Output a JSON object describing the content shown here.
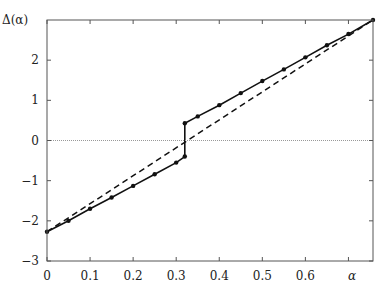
{
  "chart_data": {
    "type": "line",
    "title": "",
    "xlabel": "α",
    "ylabel": "Δ(α)",
    "xlim": [
      0,
      0.757
    ],
    "ylim": [
      -3,
      3
    ],
    "grid": false,
    "x_ticks": [
      "0",
      "0.1",
      "0.2",
      "0.3",
      "0.4",
      "0.5",
      "0.6"
    ],
    "y_ticks": [
      "−3",
      "−2",
      "−1",
      "0",
      "1",
      "2"
    ],
    "series": [
      {
        "name": "Δ(α) computed",
        "style": "solid-with-markers",
        "points": [
          [
            0.0,
            -2.27
          ],
          [
            0.05,
            -2.0
          ],
          [
            0.1,
            -1.7
          ],
          [
            0.15,
            -1.42
          ],
          [
            0.2,
            -1.13
          ],
          [
            0.25,
            -0.84
          ],
          [
            0.3,
            -0.55
          ],
          [
            0.32,
            -0.4
          ],
          [
            0.32,
            0.43
          ],
          [
            0.35,
            0.6
          ],
          [
            0.4,
            0.88
          ],
          [
            0.45,
            1.18
          ],
          [
            0.5,
            1.48
          ],
          [
            0.55,
            1.77
          ],
          [
            0.6,
            2.07
          ],
          [
            0.65,
            2.37
          ],
          [
            0.7,
            2.65
          ],
          [
            0.757,
            3.0
          ]
        ]
      },
      {
        "name": "linear reference",
        "style": "dashed",
        "points": [
          [
            0.0,
            -2.27
          ],
          [
            0.757,
            3.0
          ]
        ]
      },
      {
        "name": "zero line",
        "style": "dotted-gray",
        "points": [
          [
            0.0,
            0.0
          ],
          [
            0.757,
            0.0
          ]
        ]
      }
    ]
  }
}
